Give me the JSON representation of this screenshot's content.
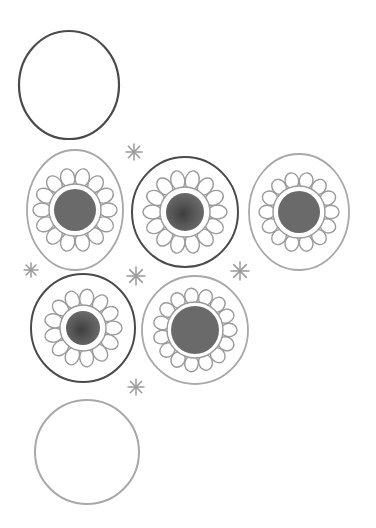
{
  "caption": "Hand-drawn pencil illustration of circles and daisy-like flower circles with asterisk sparkles",
  "colors": {
    "background": "#ffffff",
    "dark_stroke": "#4a4a4a",
    "light_stroke": "#a8a8a8",
    "petal_stroke": "#9a9a9a",
    "center_fill": "#6a6a6a",
    "center_fill_dark": "#555555",
    "sparkle": "#9a9a9a"
  },
  "empty_circles": [
    {
      "id": "top",
      "cx": 69,
      "cy": 85,
      "rx": 50,
      "ry": 54,
      "stroke": "dark"
    },
    {
      "id": "bottom",
      "cx": 87,
      "cy": 452,
      "rx": 52,
      "ry": 52,
      "stroke": "light"
    }
  ],
  "flower_circles": [
    {
      "id": "row1-left",
      "cx": 75,
      "cy": 210,
      "rx": 48,
      "ry": 60,
      "outer": "light",
      "petals": 14,
      "petal_r": 40,
      "inner_r": 26,
      "center_r": 21,
      "center": "flat"
    },
    {
      "id": "row1-middle",
      "cx": 185,
      "cy": 212,
      "rx": 53,
      "ry": 55,
      "outer": "dark",
      "petals": 14,
      "petal_r": 40,
      "inner_r": 25,
      "center_r": 19,
      "center": "mottled"
    },
    {
      "id": "row1-right",
      "cx": 299,
      "cy": 212,
      "rx": 50,
      "ry": 58,
      "outer": "light",
      "petals": 14,
      "petal_r": 38,
      "inner_r": 26,
      "center_r": 21,
      "center": "flat"
    },
    {
      "id": "row2-left",
      "cx": 83,
      "cy": 328,
      "rx": 52,
      "ry": 54,
      "outer": "dark",
      "petals": 13,
      "petal_r": 37,
      "inner_r": 23,
      "center_r": 17,
      "center": "mottled"
    },
    {
      "id": "row2-right",
      "cx": 195,
      "cy": 330,
      "rx": 53,
      "ry": 54,
      "outer": "light",
      "petals": 15,
      "petal_r": 40,
      "inner_r": 28,
      "center_r": 24,
      "center": "flat"
    }
  ],
  "sparkles": [
    {
      "x": 134,
      "y": 152,
      "r": 8
    },
    {
      "x": 31,
      "y": 270,
      "r": 7
    },
    {
      "x": 136,
      "y": 276,
      "r": 9
    },
    {
      "x": 240,
      "y": 271,
      "r": 9
    },
    {
      "x": 136,
      "y": 387,
      "r": 8
    }
  ]
}
